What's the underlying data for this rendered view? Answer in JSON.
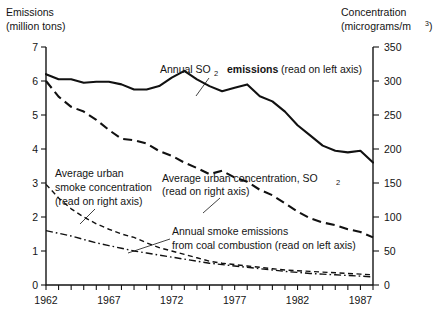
{
  "chart_data": {
    "type": "line",
    "title": "",
    "xlabel": "",
    "ylabel": "Emissions (million tons)",
    "y2label": "Concentration (micrograms/m3)",
    "xlim": [
      1962,
      1988
    ],
    "ylim": [
      0,
      7
    ],
    "y2lim": [
      0,
      350
    ],
    "grid": false,
    "legend": "annotations-inline",
    "x": [
      1962,
      1963,
      1964,
      1965,
      1966,
      1967,
      1968,
      1969,
      1970,
      1971,
      1972,
      1973,
      1974,
      1975,
      1976,
      1977,
      1978,
      1979,
      1980,
      1981,
      1982,
      1983,
      1984,
      1985,
      1986,
      1987,
      1988
    ],
    "series": [
      {
        "name": "Annual SO2 emissions (read on left axis)",
        "axis": "left",
        "units": "million tons",
        "style": "solid",
        "values": [
          6.2,
          6.05,
          6.05,
          5.95,
          5.98,
          5.98,
          5.9,
          5.75,
          5.75,
          5.85,
          6.1,
          6.3,
          6.05,
          5.85,
          5.7,
          5.8,
          5.9,
          5.55,
          5.4,
          5.1,
          4.7,
          4.4,
          4.1,
          3.95,
          3.9,
          3.95,
          3.6
        ]
      },
      {
        "name": "Average urban concentration, SO2 (read on right axis)",
        "axis": "right",
        "units": "micrograms/m3",
        "style": "long-dash",
        "values": [
          300,
          277,
          262,
          255,
          243,
          228,
          215,
          213,
          208,
          197,
          190,
          180,
          172,
          163,
          168,
          158,
          152,
          140,
          132,
          120,
          108,
          98,
          92,
          88,
          82,
          78,
          70
        ]
      },
      {
        "name": "Average urban smoke concentration (read on right axis)",
        "axis": "right",
        "units": "micrograms/m3",
        "style": "fine-dash",
        "values": [
          148,
          128,
          112,
          100,
          90,
          82,
          75,
          70,
          62,
          55,
          50,
          45,
          40,
          35,
          32,
          30,
          28,
          26,
          24,
          22,
          21,
          20,
          19,
          18,
          17,
          16,
          15
        ]
      },
      {
        "name": "Annual smoke emissions from coal combustion (read on left axis)",
        "axis": "left",
        "units": "million tons",
        "style": "dash-dot",
        "values": [
          1.6,
          1.52,
          1.44,
          1.34,
          1.24,
          1.16,
          1.08,
          1.0,
          0.94,
          0.88,
          0.82,
          0.76,
          0.7,
          0.64,
          0.6,
          0.56,
          0.52,
          0.48,
          0.44,
          0.4,
          0.37,
          0.34,
          0.32,
          0.3,
          0.28,
          0.26,
          0.24
        ]
      }
    ],
    "left_axis": {
      "caption_line1": "Emissions",
      "caption_line2": "(million tons)",
      "ticks": [
        "0",
        "1",
        "2",
        "3",
        "4",
        "5",
        "6",
        "7"
      ]
    },
    "right_axis": {
      "caption_line1": "Concentration",
      "caption_line2_pre": "(micrograms/m",
      "caption_line2_sup": "3",
      "caption_line2_post": ")",
      "ticks": [
        "0",
        "50",
        "100",
        "150",
        "200",
        "250",
        "300",
        "350"
      ]
    },
    "x_axis": {
      "labels": [
        "1962",
        "1967",
        "1972",
        "1977",
        "1982",
        "1987"
      ],
      "label_years": [
        1962,
        1967,
        1972,
        1977,
        1982,
        1987
      ]
    },
    "annotations": [
      {
        "id": "so2-emissions",
        "line1_pre": "Annual SO",
        "line1_sub": "2",
        "line1_bold": "emissions",
        "line1_post": "(read on left axis)"
      },
      {
        "id": "so2-concentration",
        "line1_pre": "Average urban concentration, SO",
        "line1_sub": "2",
        "line2": "(read on right axis)"
      },
      {
        "id": "smoke-concentration",
        "line1": "Average urban",
        "line2": "smoke concentration",
        "line3": "(read on right axis)"
      },
      {
        "id": "smoke-emissions",
        "line1": "Annual smoke emissions",
        "line2": "from coal combustion (read on left axis)"
      }
    ]
  }
}
